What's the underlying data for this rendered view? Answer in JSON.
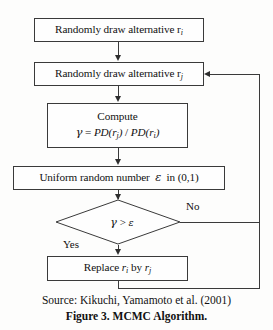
{
  "figure": {
    "background_color": "#fdfdfc",
    "line_color": "#3a3a3a",
    "caption_source": "Source: Kikuchi, Yamamoto et al. (2001)",
    "caption_title": "Figure 3. MCMC Algorithm."
  },
  "nodes": {
    "draw_i": {
      "type": "process",
      "text": "Randomly draw alternative r",
      "subscript": "i",
      "full_text": "Randomly draw alternative r_i"
    },
    "draw_j": {
      "type": "process",
      "text": "Randomly draw alternative r",
      "subscript": "j",
      "full_text": "Randomly draw alternative r_j"
    },
    "compute": {
      "type": "process",
      "line1": "Compute",
      "formula_gamma": "γ",
      "formula_eq": "=",
      "formula_num_fn": "PD",
      "formula_num_arg": "r",
      "formula_num_sub": "j",
      "formula_slash": "/",
      "formula_den_fn": "PD",
      "formula_den_arg": "r",
      "formula_den_sub": "i",
      "full_text": "Compute  γ = PD(r_j) / PD(r_i)"
    },
    "uniform": {
      "type": "process",
      "text_before": "Uniform random number",
      "symbol": "ε",
      "text_after": "in (0,1)",
      "full_text": "Uniform random number ε in (0,1)"
    },
    "decision": {
      "type": "decision",
      "left_symbol": "γ",
      "operator": ">",
      "right_symbol": "ε",
      "full_text": "γ > ε"
    },
    "replace": {
      "type": "process",
      "text_before": "Replace",
      "var1": "r",
      "var1_sub": "i",
      "text_mid": "by",
      "var2": "r",
      "var2_sub": "j",
      "full_text": "Replace r_i by r_j"
    }
  },
  "branches": {
    "no_label": "No",
    "yes_label": "Yes"
  }
}
